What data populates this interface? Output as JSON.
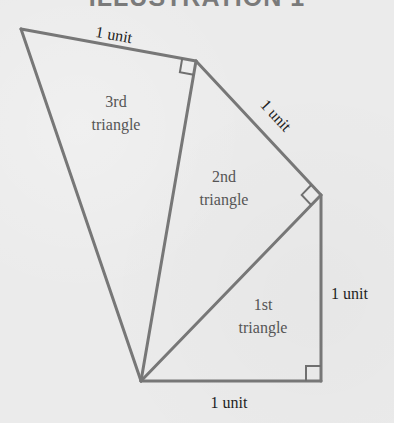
{
  "title": "ILLUSTRATION 1",
  "colors": {
    "background": "#ebebeb",
    "line": "#777777",
    "title": "#7a7a7a",
    "label_text": "#1e1e1e",
    "triangle_text": "#555555"
  },
  "diagram": {
    "type": "spiral of right triangles (square-root spiral)",
    "vertices": {
      "origin": [
        141,
        381
      ],
      "a": [
        321,
        381
      ],
      "b": [
        321,
        195
      ],
      "c": [
        196,
        61
      ],
      "d": [
        21,
        29
      ]
    },
    "edge_labels": {
      "bottom": "1 unit",
      "right": "1 unit",
      "diagonal": "1 unit",
      "top": "1 unit"
    },
    "triangles": [
      {
        "ordinal": "1st",
        "word": "triangle"
      },
      {
        "ordinal": "2nd",
        "word": "triangle"
      },
      {
        "ordinal": "3rd",
        "word": "triangle"
      }
    ]
  }
}
